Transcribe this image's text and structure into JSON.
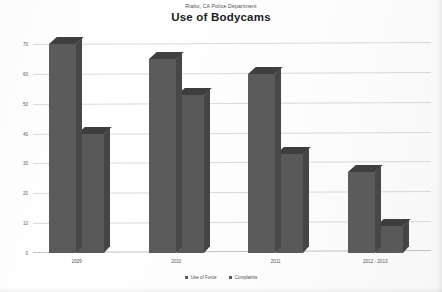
{
  "header": {
    "subtitle": "Rialto, CA Police Department",
    "title": "Use of Bodycams"
  },
  "chart_data": {
    "type": "bar",
    "title": "Use of Bodycams",
    "subtitle": "Rialto, CA Police Department",
    "categories": [
      "2009",
      "2010",
      "2011",
      "2012 - 2013"
    ],
    "series": [
      {
        "name": "Use of Force",
        "values": [
          70,
          65,
          60,
          27
        ]
      },
      {
        "name": "Complaints",
        "values": [
          40,
          53,
          33,
          9
        ]
      }
    ],
    "xlabel": "",
    "ylabel": "",
    "ylim": [
      0,
      70
    ],
    "yticks": [
      0,
      10,
      20,
      30,
      40,
      50,
      60,
      70
    ],
    "ytick_labels": [
      "0",
      "10",
      "20",
      "30",
      "40",
      "50",
      "60",
      "70"
    ],
    "grid": true,
    "legend_position": "bottom",
    "style": "3d-bar-grayscale",
    "colors": {
      "bar_face": "#5b5b5b",
      "bar_top": "#3f3f3f",
      "bar_side": "#474747",
      "grid": "#969696",
      "background": "#ffffff",
      "text": "#4e4e4e"
    }
  },
  "legend": {
    "items": [
      {
        "label": "Use of Force"
      },
      {
        "label": "Complaints"
      }
    ]
  }
}
